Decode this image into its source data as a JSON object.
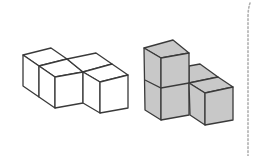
{
  "figure": {
    "colors": {
      "background": "#ffffff",
      "outline": "#3a3a3a",
      "white_fill": "#ffffff",
      "gray_fill": "#c8c8c8",
      "divider": "#b0b0b0"
    },
    "shapes": [
      {
        "name": "white-s-tetracube",
        "cube_count": 4,
        "fill": "#ffffff",
        "faces": [
          "23,55 51,48 67,59 39,66",
          "39,66 67,59 83,72 55,77",
          "67,59 96,53 112,64 83,72",
          "83,72 112,64 128,75 100,82",
          "23,55 39,66 39,97 23,86",
          "39,66 55,77 55,108 39,97",
          "55,77 83,72 83,103 55,108",
          "83,72 100,82 100,113 83,103",
          "100,82 128,75 128,108 100,113"
        ]
      },
      {
        "name": "gray-l-tetracube",
        "cube_count": 4,
        "fill": "#c8c8c8",
        "faces": [
          "189,66 200,64 218,77 189,83",
          "189,83 218,77 233,87 205,93",
          "144,48 173,40 189,53 161,58",
          "144,48 161,58 161,120 145,110",
          "161,58 189,53 189,115 161,120",
          "189,83 205,93 205,125 190,115",
          "205,93 233,87 233,120 205,125"
        ],
        "lines": [
          "145,80 161,88 189,83"
        ]
      }
    ],
    "divider": {
      "x": 248,
      "y_top": 3,
      "y_bottom": 156,
      "style": "dotted"
    }
  }
}
